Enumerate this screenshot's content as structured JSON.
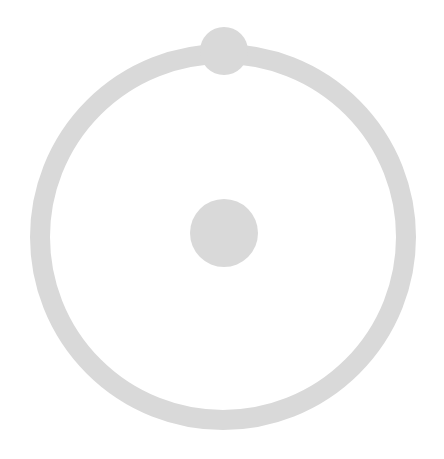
{
  "diagram": {
    "colors": {
      "background": "#ffffff",
      "shape_fill": "#d9d9d9"
    },
    "ring": {
      "cx": 223,
      "cy": 237,
      "r": 183,
      "stroke_width": 20
    },
    "center_dot": {
      "cx": 224,
      "cy": 233,
      "r": 34
    },
    "top_knob": {
      "cx": 224,
      "cy": 51,
      "r": 24
    }
  }
}
